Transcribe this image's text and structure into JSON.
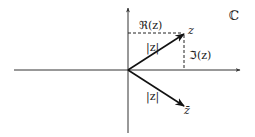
{
  "diagram": {
    "title_symbol": "ℂ",
    "labels": {
      "z": "z",
      "z_conj": "z̄",
      "real_part": "ℜ(z)",
      "imag_part": "ℑ(z)",
      "modulus_upper": "|z|",
      "modulus_lower": "|z|"
    },
    "colors": {
      "axis": "#333333",
      "vector": "#111111",
      "dashed": "#222222",
      "text": "#222222"
    }
  }
}
